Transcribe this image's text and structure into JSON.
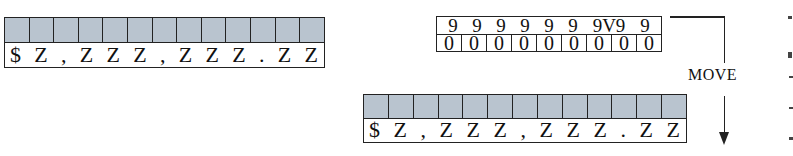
{
  "receiving_field_before": {
    "cell_count": 13,
    "cell_fill_color": "#b9c4cf",
    "picture_chars": [
      "$",
      "Z",
      ",",
      "Z",
      "Z",
      "Z",
      ",",
      "Z",
      "Z",
      "Z",
      ".",
      "Z",
      "Z"
    ]
  },
  "sending_field": {
    "picture_chars": [
      "9",
      "9",
      "9",
      "9",
      "9",
      "9",
      "9V9",
      "9"
    ],
    "values": [
      "0",
      "0",
      "0",
      "0",
      "0",
      "0",
      "0",
      "0",
      "0"
    ]
  },
  "move_arrow": {
    "label": "MOVE"
  },
  "receiving_field_after": {
    "cell_count": 13,
    "cell_fill_color": "#b9c4cf",
    "picture_chars": [
      "$",
      "Z",
      ",",
      "Z",
      "Z",
      "Z",
      ",",
      "Z",
      "Z",
      "Z",
      ".",
      "Z",
      "Z"
    ]
  }
}
